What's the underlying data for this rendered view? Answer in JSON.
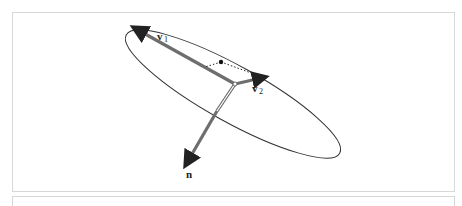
{
  "figure": {
    "ellipse": {
      "cx": 233,
      "cy": 94,
      "rx": 122,
      "ry": 28,
      "rotation_deg": 29,
      "stroke": "#333333"
    },
    "origin": {
      "x": 235,
      "y": 84
    },
    "vectors": [
      {
        "id": "v1",
        "label": "v",
        "subscript": "1",
        "tip": {
          "x": 133,
          "y": 27
        },
        "color": "#707070",
        "width": 3.5
      },
      {
        "id": "v2",
        "label": "v",
        "subscript": "2",
        "tip": {
          "x": 265,
          "y": 78
        },
        "color": "#707070",
        "width": 3.5
      },
      {
        "id": "n",
        "label": "n",
        "subscript": "",
        "tip": {
          "x": 186,
          "y": 165
        },
        "color": "#707070",
        "width": 3.5
      }
    ],
    "point": {
      "x": 221,
      "y": 62
    },
    "labels": {
      "v1_main": "v",
      "v1_sub": "1",
      "v2_main": "v",
      "v2_sub": "2",
      "n_main": "n"
    }
  }
}
